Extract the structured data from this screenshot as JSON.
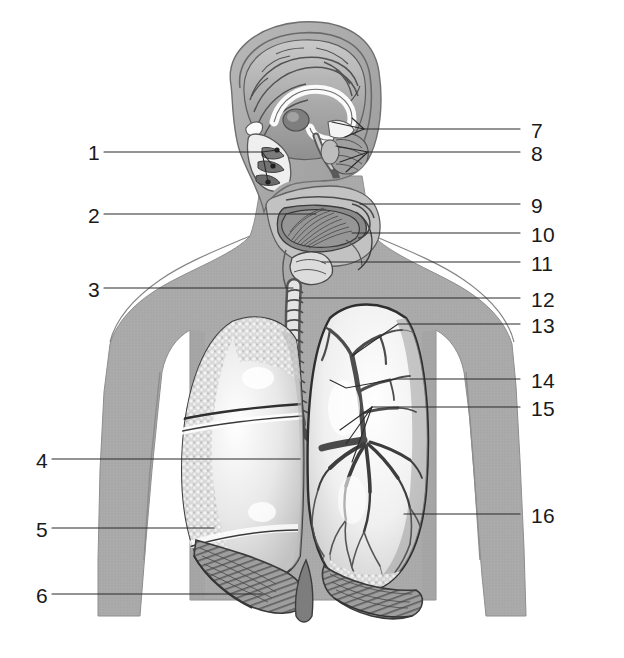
{
  "figure": {
    "type": "anatomical-illustration",
    "background_color": "#ffffff",
    "body_silhouette_color": "#a9a9a9",
    "ink_color": "#1a1a1a",
    "leader_line_color": "#2a2a2a",
    "width": 624,
    "height": 658
  },
  "labels": {
    "left": [
      {
        "id": "1",
        "text": "1",
        "x": 92,
        "y": 153
      },
      {
        "id": "2",
        "text": "2",
        "x": 92,
        "y": 216
      },
      {
        "id": "3",
        "text": "3",
        "x": 92,
        "y": 290
      },
      {
        "id": "4",
        "text": "4",
        "x": 40,
        "y": 461
      },
      {
        "id": "5",
        "text": "5",
        "x": 40,
        "y": 530
      },
      {
        "id": "6",
        "text": "6",
        "x": 40,
        "y": 596
      }
    ],
    "right": [
      {
        "id": "7",
        "text": "7",
        "x": 531,
        "y": 131
      },
      {
        "id": "8",
        "text": "8",
        "x": 531,
        "y": 154
      },
      {
        "id": "9",
        "text": "9",
        "x": 531,
        "y": 206
      },
      {
        "id": "10",
        "text": "10",
        "x": 531,
        "y": 235
      },
      {
        "id": "11",
        "text": "11",
        "x": 531,
        "y": 264
      },
      {
        "id": "12",
        "text": "12",
        "x": 531,
        "y": 300
      },
      {
        "id": "13",
        "text": "13",
        "x": 531,
        "y": 326
      },
      {
        "id": "14",
        "text": "14",
        "x": 531,
        "y": 381
      },
      {
        "id": "15",
        "text": "15",
        "x": 531,
        "y": 409
      },
      {
        "id": "16",
        "text": "16",
        "x": 531,
        "y": 516
      }
    ]
  },
  "regions": {
    "head": "sagittal-head-section",
    "brain": "cerebrum-corpus-callosum-cerebellum",
    "nasal": "nasal-cavity-with-conchae",
    "oral": "oral-cavity-and-tongue",
    "pharynx": "pharynx",
    "larynx": "larynx",
    "trachea": "trachea",
    "lung_left": "left-lung-lobes-cut-surface",
    "lung_right": "right-lung-bronchial-tree",
    "diaphragm": "diaphragm"
  }
}
